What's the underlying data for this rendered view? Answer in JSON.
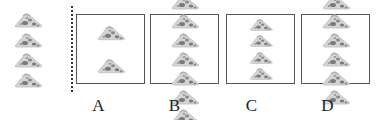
{
  "reference": {
    "item": "pizza-slice",
    "count": 4
  },
  "options": [
    {
      "label": "A",
      "count": 2,
      "columns": 1
    },
    {
      "label": "B",
      "count": 8,
      "columns": 2
    },
    {
      "label": "C",
      "count": 4,
      "columns": 1
    },
    {
      "label": "D",
      "count": 6,
      "columns": 2
    }
  ],
  "colors": {
    "crust": "#c8c8c8",
    "cheese": "#e2e2e2",
    "topping": "#7a7a7a",
    "border": "#555555"
  }
}
